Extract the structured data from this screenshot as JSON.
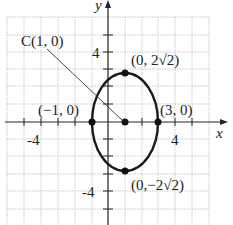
{
  "diagram": {
    "type": "ellipse-graph",
    "axes": {
      "x_label": "x",
      "y_label": "y"
    },
    "ticks": {
      "x": [
        "-4",
        "4"
      ],
      "y": [
        "4",
        "-4"
      ]
    },
    "center": {
      "label": "C(1, 0)",
      "x": 1,
      "y": 0
    },
    "vertices": [
      {
        "label": "(0, 2√2)",
        "x": 1,
        "y": 2.828
      },
      {
        "label": "(0,−2√2)",
        "x": 1,
        "y": -2.828
      }
    ],
    "covertices": [
      {
        "label": "(−1, 0)",
        "x": -1,
        "y": 0
      },
      {
        "label": "(3, 0)",
        "x": 3,
        "y": 0
      }
    ],
    "colors": {
      "curve": "#1a1a1a",
      "grid": "#b8b8b8",
      "axis": "#222222"
    }
  }
}
